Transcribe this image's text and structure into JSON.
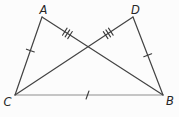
{
  "diagram": {
    "type": "geometry-figure",
    "colors": {
      "line": "#434343",
      "base_line": "#8d8d8d",
      "tick": "#3a3a3a",
      "label": "#262626",
      "background": "#fcfcfc"
    },
    "vertices": [
      {
        "label": "A",
        "x": 42,
        "y": 17,
        "label_x": 43.5,
        "label_y": 14
      },
      {
        "label": "D",
        "x": 133,
        "y": 17,
        "label_x": 135.5,
        "label_y": 14
      },
      {
        "label": "C",
        "x": 15,
        "y": 95,
        "label_x": 7.5,
        "label_y": 106
      },
      {
        "label": "B",
        "x": 163,
        "y": 95,
        "label_x": 170,
        "label_y": 105
      }
    ],
    "segments": [
      {
        "from": "A",
        "to": "C",
        "ticks": 1,
        "tick_at": 0.43,
        "tick_tilt": 0,
        "color": "#434343",
        "width": 1.2
      },
      {
        "from": "D",
        "to": "B",
        "ticks": 1,
        "tick_at": 0.49,
        "tick_tilt": 0,
        "color": "#434343",
        "width": 1.2
      },
      {
        "from": "C",
        "to": "B",
        "ticks": 1,
        "tick_at": 0.49,
        "tick_tilt": 20,
        "color": "#8d8d8d",
        "width": 1.1
      },
      {
        "from": "A",
        "to": "B",
        "ticks": 3,
        "tick_at": 0.21,
        "tick_tilt": 0,
        "color": "#434343",
        "width": 1.2
      },
      {
        "from": "D",
        "to": "C",
        "ticks": 3,
        "tick_at": 0.21,
        "tick_tilt": 0,
        "color": "#434343",
        "width": 1.2
      }
    ]
  }
}
